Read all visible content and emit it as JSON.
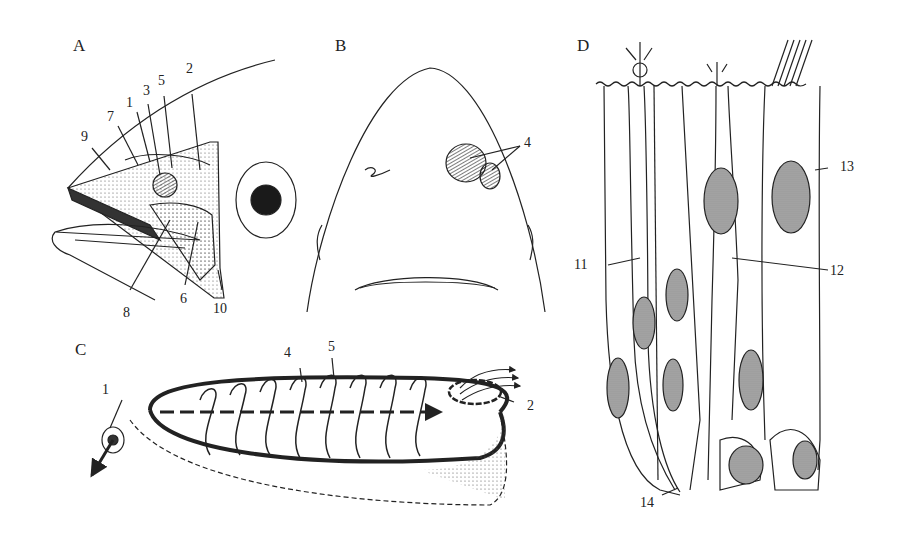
{
  "figure": {
    "panels": [
      {
        "id": "A",
        "letter": "A",
        "labels": [
          "9",
          "7",
          "1",
          "3",
          "5",
          "2",
          "8",
          "6",
          "10"
        ]
      },
      {
        "id": "B",
        "letter": "B",
        "labels": [
          "4"
        ]
      },
      {
        "id": "C",
        "letter": "C",
        "labels": [
          "1",
          "4",
          "5",
          "2"
        ]
      },
      {
        "id": "D",
        "letter": "D",
        "labels": [
          "11",
          "12",
          "13",
          "14"
        ]
      }
    ]
  },
  "colors": {
    "ink": "#222222",
    "background": "#ffffff",
    "stipple": "#888888"
  }
}
